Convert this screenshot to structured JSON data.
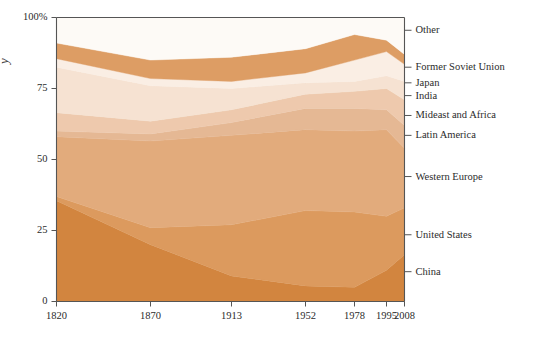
{
  "chart_data": {
    "type": "area",
    "title": "",
    "subtitle": "",
    "xlabel": "",
    "ylabel": "Share of world GDP",
    "ylim": [
      0,
      100
    ],
    "yticks": [
      0,
      25,
      50,
      75,
      100
    ],
    "ytick_labels": [
      "0",
      "25",
      "50",
      "75",
      "100%"
    ],
    "x": [
      1820,
      1870,
      1913,
      1952,
      1978,
      1995,
      2008
    ],
    "xtick_labels": [
      "1820",
      "1870",
      "1913",
      "1952",
      "1978",
      "1995",
      "2008"
    ],
    "grid": false,
    "legend_position": "right",
    "stacked": true,
    "stack_order_bottom_to_top": [
      "China",
      "United States",
      "Western Europe",
      "Latin America",
      "Mideast and Africa",
      "India",
      "Japan",
      "Former Soviet Union",
      "Other"
    ],
    "series": [
      {
        "name": "China",
        "color": "#d2853f",
        "values": [
          35.5,
          20.0,
          9.0,
          5.5,
          5.0,
          11.0,
          16.5
        ]
      },
      {
        "name": "United States",
        "color": "#dc9a5e",
        "values": [
          1.5,
          6.0,
          18.0,
          26.5,
          26.5,
          19.0,
          16.5
        ]
      },
      {
        "name": "Western Europe",
        "color": "#e2ab7c",
        "values": [
          21.0,
          30.5,
          31.5,
          28.5,
          28.5,
          30.5,
          21.0
        ]
      },
      {
        "name": "Latin America",
        "color": "#e5b894",
        "values": [
          2.0,
          2.5,
          4.5,
          7.5,
          8.0,
          7.0,
          8.0
        ]
      },
      {
        "name": "Mideast and Africa",
        "color": "#eec9ad",
        "values": [
          6.5,
          4.5,
          4.5,
          5.0,
          6.0,
          7.5,
          9.0
        ]
      },
      {
        "name": "India",
        "color": "#f6e2d2",
        "values": [
          16.0,
          12.5,
          7.5,
          4.0,
          3.5,
          4.5,
          6.5
        ]
      },
      {
        "name": "Japan",
        "color": "#faeee4",
        "values": [
          3.0,
          2.5,
          2.5,
          3.5,
          7.5,
          8.5,
          6.0
        ]
      },
      {
        "name": "Former Soviet Union",
        "color": "#dd9d64",
        "values": [
          5.5,
          6.5,
          8.5,
          8.5,
          9.0,
          4.0,
          3.5
        ]
      },
      {
        "name": "Other",
        "color": "#fdfaf6",
        "values": [
          9.0,
          15.0,
          14.0,
          11.0,
          6.0,
          8.0,
          13.0
        ]
      }
    ],
    "legend_entries": [
      {
        "label": "Other",
        "y_percent": 95.5
      },
      {
        "label": "Former Soviet Union",
        "y_percent": 82.5
      },
      {
        "label": "Japan",
        "y_percent": 77.0
      },
      {
        "label": "India",
        "y_percent": 72.5
      },
      {
        "label": "Mideast and Africa",
        "y_percent": 65.5
      },
      {
        "label": "Latin America",
        "y_percent": 58.5
      },
      {
        "label": "Western Europe",
        "y_percent": 44.0
      },
      {
        "label": "United States",
        "y_percent": 23.5
      },
      {
        "label": "China",
        "y_percent": 10.5
      }
    ]
  },
  "axis": {
    "vertical_axis_text": "y"
  },
  "colors": {
    "axis_line": "#555555",
    "text": "#2b2b2b",
    "background": "#ffffff"
  }
}
